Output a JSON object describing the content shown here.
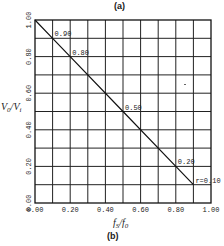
{
  "panels": {
    "top": "(a)",
    "bottom": "(b)"
  },
  "chart_data": {
    "type": "line",
    "title": "",
    "xlabel": "f_S/f_0",
    "ylabel": "V_0/V_i",
    "xlim": [
      0,
      1.0
    ],
    "ylim": [
      0,
      1.0
    ],
    "grid": true,
    "x_ticks": [
      "0.00",
      "0.20",
      "0.40",
      "0.60",
      "0.80",
      "1.00"
    ],
    "y_ticks": [
      "0.00",
      "0.20",
      "0.40",
      "0.60",
      "0.80",
      "1.00"
    ],
    "series": [
      {
        "name": "V0/Vi vs fS/f0",
        "x": [
          0.0,
          0.1,
          0.2,
          0.5,
          0.8,
          0.9
        ],
        "y": [
          1.0,
          0.9,
          0.8,
          0.5,
          0.2,
          0.1
        ]
      }
    ],
    "annotations": [
      {
        "x": 0.1,
        "y": 0.9,
        "text": "0.90"
      },
      {
        "x": 0.2,
        "y": 0.8,
        "text": "0.80"
      },
      {
        "x": 0.5,
        "y": 0.5,
        "text": "0.50"
      },
      {
        "x": 0.8,
        "y": 0.2,
        "text": "0.20"
      },
      {
        "x": 0.9,
        "y": 0.1,
        "text": "r=0.10"
      }
    ]
  },
  "axis": {
    "xlabel_main": "f",
    "xlabel_sub1": "S",
    "xlabel_mid": "/f",
    "xlabel_sub2": "0",
    "ylabel_main": "V",
    "ylabel_sub1": "0",
    "ylabel_mid": "/V",
    "ylabel_sub2": "i"
  }
}
